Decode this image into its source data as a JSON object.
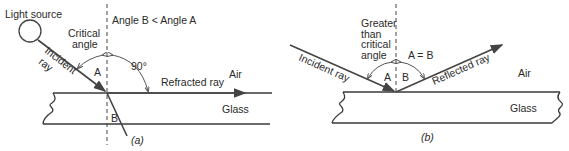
{
  "panel_a": {
    "light_source": "Light source",
    "condition": "Angle B < Angle A",
    "critical_angle_line1": "Critical",
    "critical_angle_line2": "angle",
    "incident_ray_line1": "Incident",
    "incident_ray_line2": "ray",
    "angle_a": "A",
    "angle_b": "B",
    "right_angle": "90°",
    "refracted_ray": "Refracted ray",
    "medium_top": "Air",
    "medium_bottom": "Glass",
    "caption": "(a)"
  },
  "panel_b": {
    "greater_line1": "Greater",
    "greater_line2": "than",
    "greater_line3": "critical",
    "greater_line4": "angle",
    "equality": "A = B",
    "incident_ray": "Incident ray",
    "reflected_ray": "Reflected ray",
    "angle_a": "A",
    "angle_b": "B",
    "medium_top": "Air",
    "medium_bottom": "Glass",
    "caption": "(b)"
  },
  "colors": {
    "line": "#3a3a3a",
    "text": "#2a2a2a",
    "background": "#ffffff"
  }
}
